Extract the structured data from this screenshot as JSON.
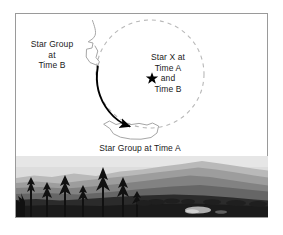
{
  "figure": {
    "frame_border_color": "#9a9a9a",
    "background_color": "#ffffff"
  },
  "diagram": {
    "dashed_circle": {
      "name": "dashed-circle-path",
      "color": "#b8b8b8",
      "center_x": 150,
      "center_y": 74,
      "radius": 54,
      "dash_pattern": "4 4"
    },
    "rotation_arrow": {
      "name": "rotation-arrow",
      "color": "#000000",
      "description": "solid black curved arrow from upper left around the left side of the circle to the bottom, pointing right"
    },
    "star_marker": {
      "name": "star-x-marker",
      "color": "#000000",
      "x": 152,
      "y": 78,
      "glyph": "five-pointed-star"
    },
    "star_group_time_b_outline": {
      "name": "star-group-time-b-outline",
      "color": "#a6a6a6"
    },
    "star_group_time_a_outline": {
      "name": "star-group-time-a-outline",
      "color": "#a6a6a6"
    }
  },
  "labels": {
    "star_group_time_b": {
      "line1": "Star Group",
      "line2": "at",
      "line3": "Time B"
    },
    "star_x": {
      "line1": "Star X at",
      "line2": "Time A",
      "line3": "and",
      "line4": "Time B"
    },
    "star_group_time_a": {
      "text": "Star Group at Time A"
    }
  },
  "photo": {
    "name": "landscape-photograph",
    "description": "grayscale photograph of layered mountain ridges with pale sky and dark coniferous trees in the foreground",
    "colors": {
      "sky": "#dcdcdc",
      "far_ridge": "#b4b4b4",
      "mid_ridge": "#9a9a9a",
      "near_ridge": "#7d7d7d",
      "valley": "#636363",
      "foreground": "#262626",
      "trees": "#141414",
      "highlight": "#d8d8d8"
    }
  }
}
